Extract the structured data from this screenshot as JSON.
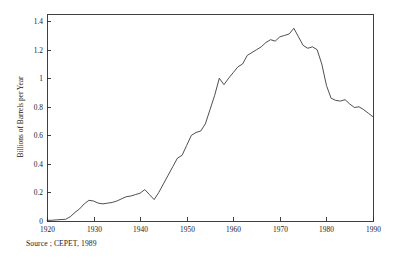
{
  "source_note": "Source ; CEPET, 1989",
  "chart_data": {
    "type": "line",
    "title": "",
    "subtitle": "",
    "xlabel": "",
    "ylabel": "Billions of Barrels per Year",
    "xlim": [
      1920,
      1990
    ],
    "ylim": [
      0,
      1.45
    ],
    "grid": false,
    "legend": false,
    "legend_position": "none",
    "x_ticks": [
      1920,
      1930,
      1940,
      1950,
      1960,
      1970,
      1980,
      1990
    ],
    "x_tick_labels": [
      "1920",
      "1930",
      "1940",
      "1950",
      "1960",
      "1970",
      "1980",
      "1990"
    ],
    "y_ticks": [
      0,
      0.2,
      0.4,
      0.6,
      0.8,
      1,
      1.2,
      1.4
    ],
    "y_tick_labels": [
      "0",
      "0.2",
      "0.4",
      "0.6",
      "0.8",
      "1",
      "1.2",
      "1.4"
    ],
    "line_color": "#2f2f2f",
    "series": [
      {
        "name": "World oil production",
        "x": [
          1920,
          1921,
          1922,
          1923,
          1924,
          1925,
          1926,
          1927,
          1928,
          1929,
          1930,
          1931,
          1932,
          1933,
          1934,
          1935,
          1936,
          1937,
          1938,
          1939,
          1940,
          1941,
          1942,
          1943,
          1944,
          1945,
          1946,
          1947,
          1948,
          1949,
          1950,
          1951,
          1952,
          1953,
          1954,
          1955,
          1956,
          1957,
          1958,
          1959,
          1960,
          1961,
          1962,
          1963,
          1964,
          1965,
          1966,
          1967,
          1968,
          1969,
          1970,
          1971,
          1972,
          1973,
          1974,
          1975,
          1976,
          1977,
          1978,
          1979,
          1980,
          1981,
          1982,
          1983,
          1984,
          1985,
          1986,
          1987,
          1988,
          1989,
          1990
        ],
        "values": [
          0.005,
          0.005,
          0.008,
          0.01,
          0.012,
          0.03,
          0.06,
          0.085,
          0.12,
          0.145,
          0.14,
          0.125,
          0.12,
          0.125,
          0.13,
          0.14,
          0.155,
          0.17,
          0.175,
          0.185,
          0.195,
          0.22,
          0.185,
          0.15,
          0.2,
          0.26,
          0.32,
          0.38,
          0.44,
          0.46,
          0.53,
          0.6,
          0.62,
          0.63,
          0.68,
          0.78,
          0.88,
          1.0,
          0.955,
          1.0,
          1.04,
          1.08,
          1.1,
          1.16,
          1.18,
          1.2,
          1.22,
          1.25,
          1.27,
          1.26,
          1.29,
          1.3,
          1.31,
          1.35,
          1.29,
          1.23,
          1.21,
          1.22,
          1.2,
          1.1,
          0.95,
          0.86,
          0.845,
          0.84,
          0.85,
          0.82,
          0.795,
          0.8,
          0.78,
          0.755,
          0.73
        ]
      }
    ],
    "annotations": [
      {
        "label": "peak",
        "x": 1973,
        "y": 1.35
      },
      {
        "label": "trough",
        "x": 1985,
        "y": 0.62
      }
    ]
  }
}
